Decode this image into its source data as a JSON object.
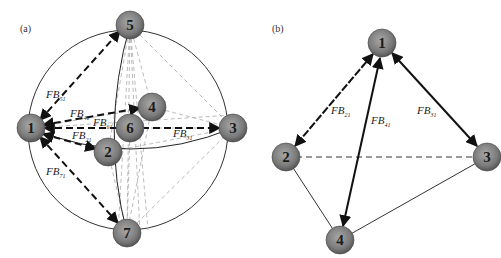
{
  "panels": [
    {
      "id": "a",
      "label": "(a)",
      "nodes": [
        {
          "id": "1",
          "label": "1",
          "x": 31,
          "y": 128
        },
        {
          "id": "5",
          "label": "5",
          "x": 130,
          "y": 25
        },
        {
          "id": "4",
          "label": "4",
          "x": 152,
          "y": 107
        },
        {
          "id": "6",
          "label": "6",
          "x": 130,
          "y": 128
        },
        {
          "id": "3",
          "label": "3",
          "x": 233,
          "y": 128
        },
        {
          "id": "2",
          "label": "2",
          "x": 108,
          "y": 152
        },
        {
          "id": "7",
          "label": "7",
          "x": 127,
          "y": 233
        }
      ],
      "edge_labels": [
        {
          "text": "FB",
          "sub": "51",
          "x": 46,
          "y": 98
        },
        {
          "text": "FB",
          "sub": "41",
          "x": 70,
          "y": 117
        },
        {
          "text": "FB",
          "sub": "61",
          "x": 93,
          "y": 126
        },
        {
          "text": "FB",
          "sub": "21",
          "x": 72,
          "y": 139
        },
        {
          "text": "FB",
          "sub": "31",
          "x": 173,
          "y": 137
        },
        {
          "text": "FB",
          "sub": "71",
          "x": 46,
          "y": 175
        }
      ]
    },
    {
      "id": "b",
      "label": "(b)",
      "nodes": [
        {
          "id": "1",
          "label": "1",
          "x": 382,
          "y": 43
        },
        {
          "id": "2",
          "label": "2",
          "x": 286,
          "y": 157
        },
        {
          "id": "3",
          "label": "3",
          "x": 487,
          "y": 157
        },
        {
          "id": "4",
          "label": "4",
          "x": 340,
          "y": 240
        }
      ],
      "edge_labels": [
        {
          "text": "FB",
          "sub": "21",
          "x": 331,
          "y": 114
        },
        {
          "text": "FB",
          "sub": "41",
          "x": 371,
          "y": 124
        },
        {
          "text": "FB",
          "sub": "31",
          "x": 417,
          "y": 114
        }
      ]
    }
  ],
  "colors": {
    "node_fill_center": "#9a9a9a",
    "node_fill_edge": "#5a5a5a",
    "edge_dark": "#222222",
    "edge_light": "#aaaaaa"
  }
}
